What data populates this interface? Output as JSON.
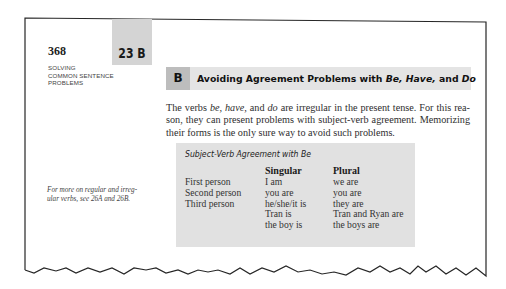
{
  "page": {
    "number": "368",
    "tab_label": "23 B",
    "running_head": [
      "SOLVING",
      "COMMON SENTENCE",
      "PROBLEMS"
    ]
  },
  "section": {
    "letter": "B",
    "title_prefix": "Avoiding Agreement Problems with ",
    "title_italic": "Be, Have,",
    "title_mid": " and ",
    "title_italic_2": "Do"
  },
  "body": {
    "lines": [
      {
        "parts": [
          {
            "text": "The verbs ",
            "italic": false
          },
          {
            "text": "be, have,",
            "italic": true
          },
          {
            "text": " and ",
            "italic": false
          },
          {
            "text": "do",
            "italic": true
          },
          {
            "text": " are irregular in the present tense. For this rea-",
            "italic": false
          }
        ]
      },
      {
        "parts": [
          {
            "text": "son, they can present problems with subject-verb agreement. Memorizing",
            "italic": false
          }
        ]
      },
      {
        "parts": [
          {
            "text": "their forms is the only sure way to avoid such problems.",
            "italic": false
          }
        ]
      }
    ]
  },
  "margin_note": {
    "lines": [
      "For more on regular and irreg-",
      "ular verbs, see 26A and 26B."
    ]
  },
  "table": {
    "title": "Subject-Verb Agreement with Be",
    "columns": [
      "",
      "Singular",
      "Plural"
    ],
    "rows": [
      [
        "First person",
        "I am",
        "we are"
      ],
      [
        "Second person",
        "you are",
        "you are"
      ],
      [
        "Third person",
        "he/she/it is",
        "they are"
      ],
      [
        "",
        "Tran is",
        "Tran and Ryan are"
      ],
      [
        "",
        "the boy is",
        "the boys are"
      ]
    ]
  },
  "colors": {
    "tab_bg": "#d4d4d4",
    "section_bar_bg": "#e4e4e4",
    "section_letter_bg": "#bdbdbd",
    "table_bg": "#e1e1e1",
    "border": "#222222"
  }
}
